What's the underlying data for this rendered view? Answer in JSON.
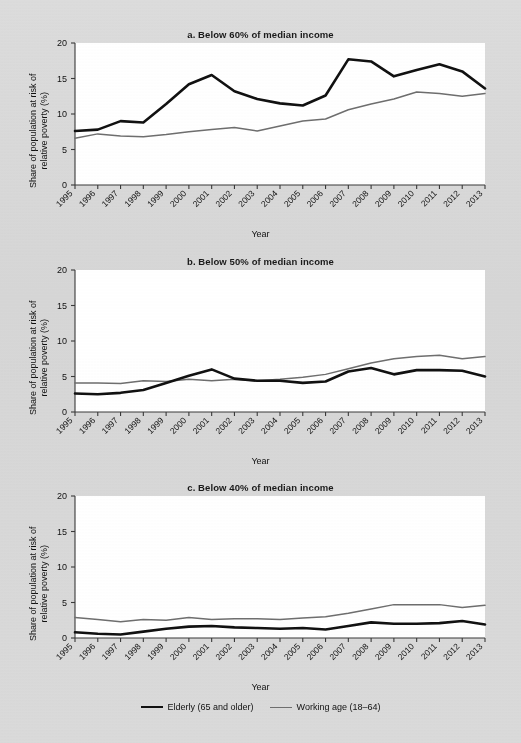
{
  "figure": {
    "background_color": "#d9d9d9",
    "plot_background_color": "#ffffff",
    "elderly_color": "#111111",
    "working_color": "#6e6e6e"
  },
  "legend": {
    "items": [
      {
        "label": "Elderly (65 and older)",
        "color": "#111111"
      },
      {
        "label": "Working age (18–64)",
        "color": "#6e6e6e"
      }
    ]
  },
  "axis": {
    "ylabel": "Share of population at risk of relative poverty (%)",
    "ylabel_line1": "Share of population at risk of",
    "ylabel_line2": "relative poverty (%)",
    "xlabel": "Year",
    "yticks": [
      "0",
      "5",
      "10",
      "15",
      "20"
    ],
    "ylim": [
      0,
      20
    ],
    "xticks": [
      "1995",
      "1996",
      "1997",
      "1998",
      "1999",
      "2000",
      "2001",
      "2002",
      "2003",
      "2004",
      "2005",
      "2006",
      "2007",
      "2008",
      "2009",
      "2010",
      "2011",
      "2012",
      "2013"
    ]
  },
  "chart_data": [
    {
      "type": "line",
      "panel": "a",
      "title": "a. Below 60% of median income",
      "xlabel": "Year",
      "ylabel": "Share of population at risk of relative poverty (%)",
      "ylim": [
        0,
        20
      ],
      "yticks": [
        0,
        5,
        10,
        15,
        20
      ],
      "grid": false,
      "legend_position": "bottom-figure",
      "x": [
        1995,
        1996,
        1997,
        1998,
        1999,
        2000,
        2001,
        2002,
        2003,
        2004,
        2005,
        2006,
        2007,
        2008,
        2009,
        2010,
        2011,
        2012,
        2013
      ],
      "series": [
        {
          "name": "Elderly (65 and older)",
          "color": "#111111",
          "values": [
            7.6,
            7.8,
            9.0,
            8.8,
            11.4,
            14.2,
            15.5,
            13.2,
            12.1,
            11.5,
            11.2,
            12.6,
            17.7,
            17.4,
            15.3,
            16.2,
            17.0,
            16.0,
            13.6
          ]
        },
        {
          "name": "Working age (18–64)",
          "color": "#6e6e6e",
          "values": [
            6.6,
            7.2,
            6.9,
            6.8,
            7.1,
            7.5,
            7.8,
            8.1,
            7.6,
            8.3,
            9.0,
            9.3,
            10.6,
            11.4,
            12.1,
            13.1,
            12.9,
            12.5,
            12.9
          ]
        }
      ]
    },
    {
      "type": "line",
      "panel": "b",
      "title": "b. Below 50% of median income",
      "xlabel": "Year",
      "ylabel": "Share of population at risk of relative poverty (%)",
      "ylim": [
        0,
        20
      ],
      "yticks": [
        0,
        5,
        10,
        15,
        20
      ],
      "grid": false,
      "legend_position": "bottom-figure",
      "x": [
        1995,
        1996,
        1997,
        1998,
        1999,
        2000,
        2001,
        2002,
        2003,
        2004,
        2005,
        2006,
        2007,
        2008,
        2009,
        2010,
        2011,
        2012,
        2013
      ],
      "series": [
        {
          "name": "Elderly (65 and older)",
          "color": "#111111",
          "values": [
            2.6,
            2.5,
            2.7,
            3.1,
            4.1,
            5.1,
            6.0,
            4.7,
            4.4,
            4.4,
            4.1,
            4.3,
            5.7,
            6.2,
            5.3,
            5.9,
            5.9,
            5.8,
            5.0
          ]
        },
        {
          "name": "Working age (18–64)",
          "color": "#6e6e6e",
          "values": [
            4.1,
            4.1,
            4.0,
            4.4,
            4.3,
            4.6,
            4.4,
            4.6,
            4.4,
            4.6,
            4.9,
            5.3,
            6.1,
            6.9,
            7.5,
            7.8,
            8.0,
            7.5,
            7.8
          ]
        }
      ]
    },
    {
      "type": "line",
      "panel": "c",
      "title": "c. Below 40% of median income",
      "xlabel": "Year",
      "ylabel": "Share of population at risk of relative poverty (%)",
      "ylim": [
        0,
        20
      ],
      "yticks": [
        0,
        5,
        10,
        15,
        20
      ],
      "grid": false,
      "legend_position": "bottom-figure",
      "x": [
        1995,
        1996,
        1997,
        1998,
        1999,
        2000,
        2001,
        2002,
        2003,
        2004,
        2005,
        2006,
        2007,
        2008,
        2009,
        2010,
        2011,
        2012,
        2013
      ],
      "series": [
        {
          "name": "Elderly (65 and older)",
          "color": "#111111",
          "values": [
            0.8,
            0.6,
            0.5,
            0.9,
            1.3,
            1.6,
            1.7,
            1.5,
            1.4,
            1.3,
            1.4,
            1.2,
            1.7,
            2.2,
            2.0,
            2.0,
            2.1,
            2.4,
            1.9
          ]
        },
        {
          "name": "Working age (18–64)",
          "color": "#6e6e6e",
          "values": [
            2.9,
            2.6,
            2.3,
            2.6,
            2.5,
            2.9,
            2.6,
            2.7,
            2.7,
            2.6,
            2.8,
            3.0,
            3.5,
            4.1,
            4.7,
            4.7,
            4.7,
            4.3,
            4.6
          ]
        }
      ]
    }
  ]
}
